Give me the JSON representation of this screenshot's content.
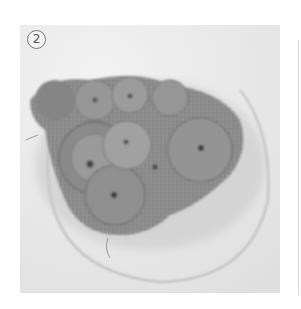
{
  "image": {
    "subject": "Crocheted flower motifs arranged on a plate (grayscale photo)",
    "step_label": "2",
    "colors": {
      "background": "#e9e9e9",
      "crochet_dark": "#7d7d7d",
      "crochet_light": "#a8a8a8",
      "plate_rim": "#bdbdbd"
    }
  }
}
